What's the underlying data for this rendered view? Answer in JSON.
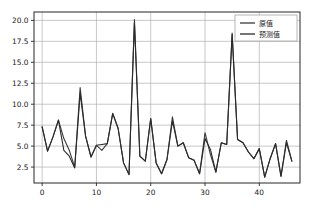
{
  "chart_data": {
    "type": "line",
    "title": "",
    "xlabel": "",
    "ylabel": "",
    "xlim": [
      -1.5,
      47.5
    ],
    "ylim": [
      0.6,
      21.0
    ],
    "xticks": [
      0,
      10,
      20,
      30,
      40
    ],
    "yticks": [
      2.5,
      5.0,
      7.5,
      10.0,
      12.5,
      15.0,
      17.5,
      20.0
    ],
    "xticklabels": [
      "0",
      "10",
      "20",
      "30",
      "40"
    ],
    "yticklabels": [
      "2.5",
      "5.0",
      "7.5",
      "10.0",
      "12.5",
      "15.0",
      "17.5",
      "20.0"
    ],
    "grid": true,
    "grid_color": "#b0b0b0",
    "legend_position": "upper right",
    "x": [
      0,
      1,
      2,
      3,
      4,
      5,
      6,
      7,
      8,
      9,
      10,
      11,
      12,
      13,
      14,
      15,
      16,
      17,
      18,
      19,
      20,
      21,
      22,
      23,
      24,
      25,
      26,
      27,
      28,
      29,
      30,
      31,
      32,
      33,
      34,
      35,
      36,
      37,
      38,
      39,
      40,
      41,
      42,
      43,
      44,
      45,
      46
    ],
    "series": [
      {
        "name": "原值",
        "color": "#3a3a3a",
        "linewidth": 1.1,
        "values": [
          7.3,
          4.4,
          6.1,
          8.1,
          5.9,
          4.5,
          2.5,
          12.0,
          6.2,
          3.7,
          5.1,
          4.5,
          5.3,
          8.9,
          7.1,
          3.0,
          1.6,
          20.1,
          3.8,
          3.2,
          8.3,
          3.0,
          1.7,
          3.4,
          8.5,
          5.0,
          5.4,
          3.6,
          3.3,
          1.7,
          6.6,
          4.0,
          1.9,
          5.4,
          5.2,
          18.5,
          5.8,
          5.4,
          4.3,
          3.5,
          4.7,
          1.3,
          3.5,
          5.3,
          1.4,
          5.7,
          3.2
        ]
      },
      {
        "name": "预测值",
        "color": "#2b2b2b",
        "linewidth": 1.1,
        "values": [
          7.3,
          4.4,
          6.1,
          8.1,
          4.5,
          3.8,
          2.4,
          11.3,
          6.2,
          3.7,
          5.1,
          5.2,
          5.3,
          8.9,
          7.1,
          3.0,
          1.6,
          19.7,
          3.8,
          3.2,
          8.3,
          3.0,
          1.7,
          3.4,
          8.0,
          5.0,
          5.4,
          3.6,
          3.3,
          1.7,
          5.9,
          4.6,
          1.9,
          5.4,
          5.2,
          18.3,
          5.8,
          5.4,
          4.3,
          3.5,
          4.7,
          1.3,
          3.5,
          5.3,
          1.4,
          5.4,
          3.2
        ]
      }
    ]
  },
  "legend": {
    "entries": [
      {
        "label": "原值"
      },
      {
        "label": "预测值"
      }
    ]
  },
  "axes": {
    "spine_color": "#262626",
    "background": "#ffffff"
  }
}
